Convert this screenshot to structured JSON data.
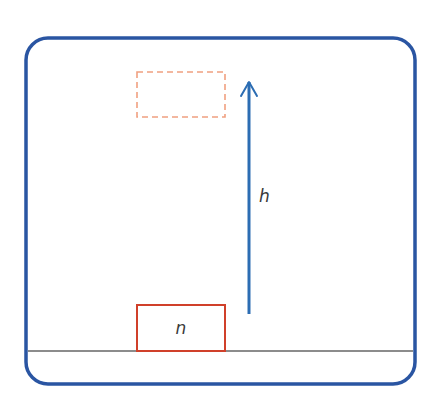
{
  "diagram": {
    "width": 445,
    "height": 409,
    "frame": {
      "x": 26,
      "y": 38,
      "width": 389,
      "height": 346,
      "rx": 22,
      "stroke": "#2a55a2",
      "stroke_width": 3.5
    },
    "ground": {
      "x1": 28,
      "x2": 413,
      "y": 351,
      "stroke": "#1a1a1a",
      "stroke_width": 1.2
    },
    "object_initial": {
      "label": "n",
      "x": 137,
      "y": 305,
      "width": 88,
      "height": 46,
      "stroke": "#d0402a",
      "stroke_width": 2,
      "style": "solid"
    },
    "object_final": {
      "x": 137,
      "y": 72,
      "width": 88,
      "height": 45,
      "stroke": "#f0a080",
      "stroke_width": 1.6,
      "style": "dashed"
    },
    "height_arrow": {
      "label": "h",
      "x": 249,
      "y_start": 314,
      "y_end": 82,
      "stroke": "#2c6db3",
      "stroke_width": 3
    }
  }
}
